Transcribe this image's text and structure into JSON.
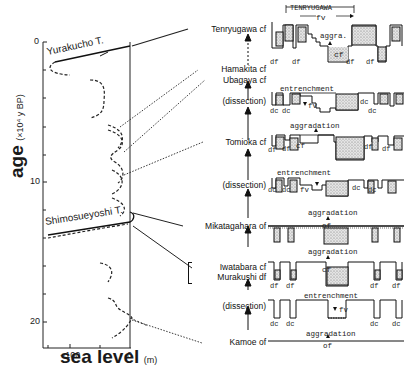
{
  "figure": {
    "left_panel": {
      "y_axis": {
        "title": "age",
        "unit": "(×10⁴ y BP)",
        "ticks": [
          "0",
          "10",
          "20"
        ]
      },
      "x_axis": {
        "title": "sea level",
        "unit": "(m)",
        "ticks": [
          "−100",
          "0"
        ]
      },
      "tephra_markers": [
        {
          "name": "Yurakucho T.",
          "age_x10_4": 0.7
        },
        {
          "name": "Shimosueyoshi T.",
          "age_x10_4": 12.5
        }
      ]
    },
    "stages": [
      {
        "label": "Tenryugawa cf",
        "type": "aggradation"
      },
      {
        "label": "Hamakita cf",
        "type": "terrace"
      },
      {
        "label": "Ubagaya cf",
        "type": "terrace"
      },
      {
        "label": "(dissection)",
        "type": "entrenchment"
      },
      {
        "label": "Tomioka cf",
        "type": "aggradation"
      },
      {
        "label": "(dissection)",
        "type": "entrenchment"
      },
      {
        "label": "Mikatagahara of",
        "type": "aggradation"
      },
      {
        "label": "Iwatabara cf",
        "type": "aggradation"
      },
      {
        "label": "Murakushi df",
        "type": "aggradation"
      },
      {
        "label": "(dissection)",
        "type": "entrenchment"
      },
      {
        "label": "Kamoe of",
        "type": "base"
      }
    ],
    "sections": {
      "s1": {
        "bracket": "TENRYUGAWA",
        "fv": "fv",
        "process": "aggra.",
        "fill": "cf",
        "side_labels": [
          "df",
          "df",
          "df",
          "df"
        ]
      },
      "s2": {
        "process": "entrenchment",
        "fv": "fv",
        "side_labels": [
          "dc",
          "dc",
          "dc",
          "dc"
        ]
      },
      "s3": {
        "process": "aggradation",
        "fill": "cf",
        "side_labels": [
          "df",
          "df",
          "df",
          "df"
        ]
      },
      "s4": {
        "process": "entrenchment",
        "fv": "fv",
        "side_labels": [
          "dc",
          "dc",
          "dc",
          "dc"
        ]
      },
      "s5": {
        "process": "aggradation",
        "fill": "of"
      },
      "s6": {
        "process": "aggradation",
        "fill": "cf",
        "side_labels": [
          "df",
          "df",
          "df",
          "df"
        ]
      },
      "s7": {
        "process": "entrenchment",
        "fv": "fv",
        "side_labels": [
          "dc",
          "dc",
          "dc",
          "dc"
        ]
      },
      "s8": {
        "process": "aggradation",
        "fill": "of"
      }
    },
    "colors": {
      "ink": "#1a1a1a",
      "stipple": "#c8c8c8",
      "background": "#ffffff"
    }
  }
}
